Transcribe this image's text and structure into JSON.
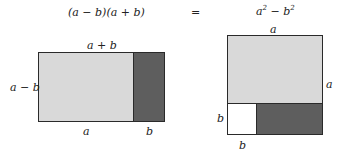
{
  "header": {
    "left_expr": "(a − b)(a + b)",
    "equals": "=",
    "right_expr_base_a": "a",
    "right_expr_sup_a": "2",
    "right_expr_minus": " − ",
    "right_expr_base_b": "b",
    "right_expr_sup_b": "2"
  },
  "left_figure": {
    "top_label": "a + b",
    "left_label": "a − b",
    "bottom_label_a": "a",
    "bottom_label_b": "b"
  },
  "right_figure": {
    "top_label": "a",
    "right_label": "a",
    "left_label": "b",
    "bottom_label": "b"
  },
  "colors": {
    "light_fill": "#d9d9d9",
    "dark_fill": "#5e5e5e",
    "white_fill": "#ffffff",
    "stroke": "#2a2a2a"
  }
}
